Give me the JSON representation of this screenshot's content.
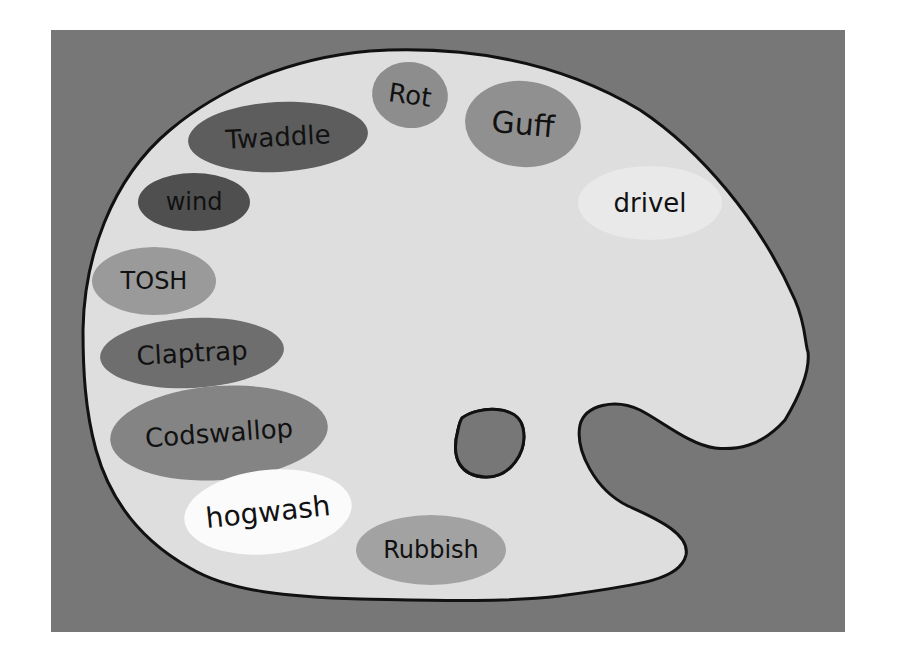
{
  "illustration": {
    "subject": "painter's palette with paint blobs",
    "colors": {
      "page_background": "#ffffff",
      "panel_background": "#777777",
      "palette_fill": "#dedede",
      "palette_outline": "#111111",
      "text": "#111111"
    },
    "blobs": [
      {
        "label": "Rot",
        "cx": 410,
        "cy": 95,
        "rx": 38,
        "ry": 33,
        "rotate": 8,
        "fill": "#8d8d8d",
        "font_size": 26
      },
      {
        "label": "Guff",
        "cx": 523,
        "cy": 124,
        "rx": 58,
        "ry": 43,
        "rotate": 5,
        "fill": "#909090",
        "font_size": 30
      },
      {
        "label": "Twaddle",
        "cx": 278,
        "cy": 137,
        "rx": 90,
        "ry": 35,
        "rotate": -3,
        "fill": "#5d5d5d",
        "font_size": 26
      },
      {
        "label": "wind",
        "cx": 194,
        "cy": 202,
        "rx": 56,
        "ry": 29,
        "rotate": 0,
        "fill": "#4f4f4f",
        "font_size": 24
      },
      {
        "label": "drivel",
        "cx": 650,
        "cy": 203,
        "rx": 72,
        "ry": 37,
        "rotate": 0,
        "fill": "#e9e9e9",
        "font_size": 26
      },
      {
        "label": "TOSH",
        "cx": 154,
        "cy": 281,
        "rx": 62,
        "ry": 34,
        "rotate": 0,
        "fill": "#9a9a9a",
        "font_size": 24
      },
      {
        "label": "Claptrap",
        "cx": 192,
        "cy": 353,
        "rx": 92,
        "ry": 35,
        "rotate": -3,
        "fill": "#6e6e6e",
        "font_size": 26
      },
      {
        "label": "Codswallop",
        "cx": 219,
        "cy": 433,
        "rx": 109,
        "ry": 47,
        "rotate": -4,
        "fill": "#848484",
        "font_size": 26
      },
      {
        "label": "hogwash",
        "cx": 268,
        "cy": 512,
        "rx": 84,
        "ry": 42,
        "rotate": -6,
        "fill": "#fbfbfb",
        "font_size": 28
      },
      {
        "label": "Rubbish",
        "cx": 431,
        "cy": 550,
        "rx": 75,
        "ry": 35,
        "rotate": 0,
        "fill": "#a2a2a2",
        "font_size": 24
      }
    ]
  }
}
